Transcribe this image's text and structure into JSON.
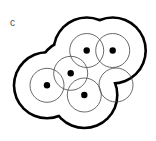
{
  "panel_label": "c",
  "colors": {
    "outline": "#000000",
    "circle": "#444444",
    "dot": "#000000",
    "background": "#ffffff"
  },
  "outline": {
    "radius": 33,
    "stroke_width": 2.6
  },
  "circle_radius": 17,
  "points": [
    {
      "x": 86.7,
      "y": 50.5,
      "dot": true
    },
    {
      "x": 112.7,
      "y": 50.5,
      "dot": true
    },
    {
      "x": 70.7,
      "y": 73.3,
      "dot": true
    },
    {
      "x": 47.0,
      "y": 85.3,
      "dot": true
    },
    {
      "x": 84.3,
      "y": 95.0,
      "dot": true
    },
    {
      "x": 116.0,
      "y": 85.0,
      "dot": false
    }
  ]
}
